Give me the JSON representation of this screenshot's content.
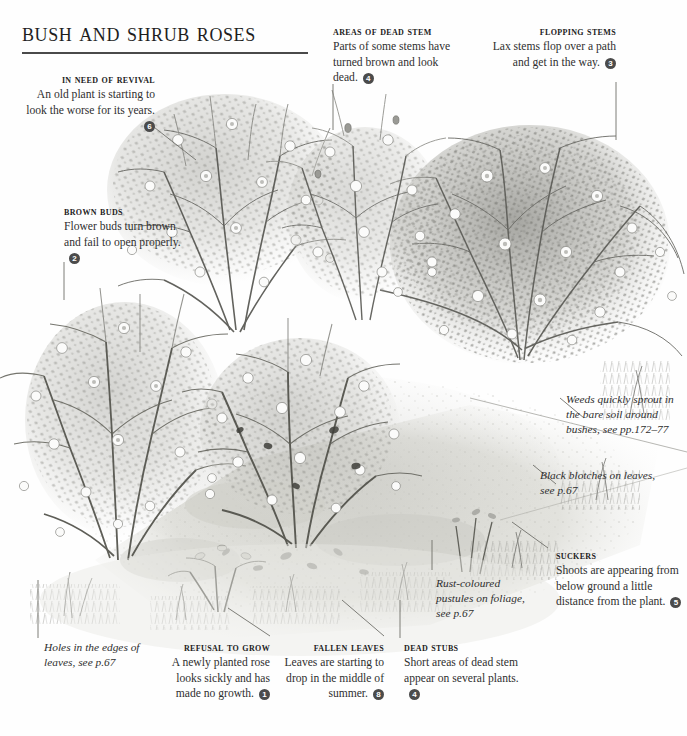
{
  "page": {
    "title": "Bush and shrub roses",
    "width": 687,
    "height": 736,
    "background_color": "#fefefe",
    "ink_color": "#2f2f2f",
    "badge_color": "#4b4b4b"
  },
  "illustration": {
    "name": "bush-and-shrub-roses-illustration",
    "description": "Grayscale pen-and-ink garden border illustration showing several neglected bush and shrub roses with weeds, fallen leaves and bare soil",
    "style": "monochrome-line-and-wash"
  },
  "callouts": [
    {
      "id": "in-need-of-revival",
      "heading": "In need of revival",
      "body": "An old plant is starting to look the worse for its years.",
      "badge": "6",
      "align": "right"
    },
    {
      "id": "areas-of-dead-stem",
      "heading": "Areas of dead stem",
      "body": "Parts of some stems have turned brown and look dead.",
      "badge": "4",
      "align": "left"
    },
    {
      "id": "flopping-stems",
      "heading": "Flopping stems",
      "body": "Lax stems flop over a path and get in the way.",
      "badge": "3",
      "align": "right"
    },
    {
      "id": "brown-buds",
      "heading": "Brown buds",
      "body": "Flower buds turn brown and fail to open properly.",
      "badge": "2",
      "align": "left"
    },
    {
      "id": "suckers",
      "heading": "Suckers",
      "body": "Shoots are appearing from below ground a little distance from the plant.",
      "badge": "5",
      "align": "left"
    },
    {
      "id": "refusal-to-grow",
      "heading": "Refusal to grow",
      "body": "A newly planted rose looks sickly and has made no growth.",
      "badge": "1",
      "align": "right"
    },
    {
      "id": "fallen-leaves",
      "heading": "Fallen leaves",
      "body": "Leaves are starting to drop in the middle of summer.",
      "badge": "8",
      "align": "right"
    },
    {
      "id": "dead-stubs",
      "heading": "Dead stubs",
      "body": "Short areas of dead stem appear on several plants.",
      "badge": "4",
      "align": "left"
    }
  ],
  "notes": [
    {
      "id": "weeds",
      "text": "Weeds quickly sprout in the bare soil around bushes, see pp.172–77"
    },
    {
      "id": "black-blotches",
      "text": "Black blotches on leaves, see p.67"
    },
    {
      "id": "rust-pustules",
      "text": "Rust-coloured pustules on foliage, see p.67"
    },
    {
      "id": "holes-in-leaves",
      "text": "Holes in the edges of leaves, see p.67"
    }
  ]
}
